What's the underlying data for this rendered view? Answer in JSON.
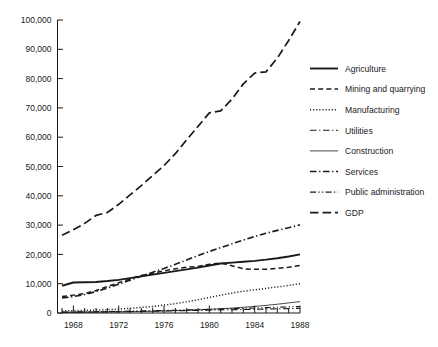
{
  "chart_data": {
    "type": "line",
    "title": "",
    "subtitle": "",
    "xlabel": "",
    "ylabel": "",
    "xlim": [
      1966.6,
      1988
    ],
    "ylim": [
      0,
      100000
    ],
    "grid": false,
    "legend_position": "right",
    "x_ticks_major": [
      1968,
      1972,
      1976,
      1980,
      1984,
      1988
    ],
    "x_tick_labels": [
      "1968",
      "1972",
      "1976",
      "1980",
      "1984",
      "1988"
    ],
    "x_ticks_minor_step": 1,
    "y_ticks": [
      0,
      10000,
      20000,
      30000,
      40000,
      50000,
      60000,
      70000,
      80000,
      90000,
      100000
    ],
    "y_tick_labels": [
      "0",
      "10,000",
      "20,000",
      "30,000",
      "40,000",
      "50,000",
      "60,000",
      "70,000",
      "80,000",
      "90,000",
      "100,000"
    ],
    "x": [
      1967,
      1968,
      1969,
      1970,
      1971,
      1972,
      1973,
      1974,
      1975,
      1976,
      1977,
      1978,
      1979,
      1980,
      1981,
      1982,
      1983,
      1984,
      1985,
      1986,
      1987,
      1988
    ],
    "series": [
      {
        "name": "Agriculture",
        "dash": "solid",
        "width": 1.9,
        "values": [
          9300,
          10400,
          10500,
          10600,
          10900,
          11300,
          11900,
          12500,
          13100,
          13700,
          14300,
          14900,
          15500,
          16200,
          16900,
          17200,
          17500,
          17800,
          18200,
          18700,
          19300,
          20000
        ]
      },
      {
        "name": "Mining and quarrying",
        "dash": "dashed",
        "width": 1.5,
        "values": [
          5600,
          6100,
          6600,
          7700,
          9000,
          10300,
          11600,
          12800,
          13600,
          14400,
          15100,
          15600,
          15900,
          16600,
          17100,
          16100,
          15100,
          14900,
          14900,
          15200,
          15600,
          16200
        ]
      },
      {
        "name": "Manufacturing",
        "dash": "dotted",
        "width": 1.5,
        "values": [
          700,
          800,
          900,
          1000,
          1150,
          1350,
          1600,
          1900,
          2250,
          2700,
          3200,
          3800,
          4500,
          5300,
          6100,
          6800,
          7400,
          7900,
          8400,
          8900,
          9400,
          10000
        ]
      },
      {
        "name": "Utilities",
        "dash": "dashdot",
        "width": 1.1,
        "values": [
          260,
          290,
          320,
          360,
          400,
          450,
          500,
          560,
          620,
          690,
          760,
          830,
          900,
          980,
          1060,
          1130,
          1200,
          1270,
          1340,
          1420,
          1500,
          1600
        ]
      },
      {
        "name": "Construction",
        "dash": "solid",
        "width": 0.8,
        "values": [
          200,
          230,
          260,
          300,
          340,
          390,
          450,
          520,
          600,
          690,
          800,
          930,
          1080,
          1250,
          1450,
          1680,
          1950,
          2250,
          2600,
          3000,
          3450,
          3900
        ]
      },
      {
        "name": "Services",
        "dash": "dashdot",
        "width": 1.6,
        "values": [
          5100,
          5600,
          6300,
          7300,
          8500,
          9800,
          11200,
          12600,
          13900,
          15200,
          16600,
          18100,
          19600,
          21000,
          22300,
          23600,
          24900,
          26100,
          27200,
          28200,
          29100,
          30100
        ]
      },
      {
        "name": "Public administration",
        "dash": "dashdotdot",
        "width": 1.1,
        "values": [
          320,
          360,
          400,
          450,
          500,
          560,
          630,
          700,
          780,
          870,
          960,
          1060,
          1160,
          1270,
          1380,
          1490,
          1600,
          1720,
          1840,
          1960,
          2090,
          2220
        ]
      },
      {
        "name": "GDP",
        "dash": "longdash",
        "width": 1.7,
        "values": [
          26500,
          28400,
          30600,
          33300,
          34300,
          37100,
          40300,
          43500,
          46900,
          50300,
          54400,
          59100,
          63700,
          68300,
          69000,
          73000,
          78200,
          81900,
          82300,
          87000,
          93000,
          99500
        ]
      }
    ]
  },
  "legend": {
    "items": [
      {
        "label": "Agriculture"
      },
      {
        "label": "Mining and quarrying"
      },
      {
        "label": "Manufacturing"
      },
      {
        "label": "Utilities"
      },
      {
        "label": "Construction"
      },
      {
        "label": "Services"
      },
      {
        "label": "Public administration"
      },
      {
        "label": "GDP"
      }
    ]
  }
}
